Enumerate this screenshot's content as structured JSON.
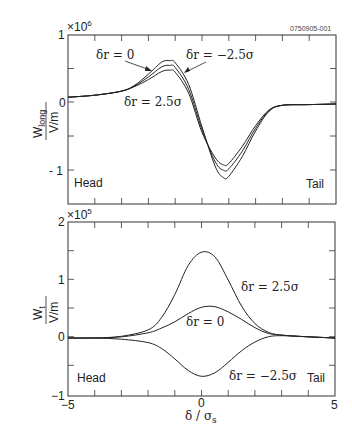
{
  "figure_id": "0750905-001",
  "chart_data": [
    {
      "type": "line",
      "panel": "top",
      "title": "",
      "xlabel": "δ / σs",
      "ylabel_numerator": "W_long",
      "ylabel_denominator": "V/m",
      "y_multiplier": "×10^6",
      "xlim": [
        -5,
        5
      ],
      "ylim": [
        -1.5,
        1
      ],
      "yticks": [
        1,
        0,
        -1
      ],
      "ytick_labels": [
        "1",
        "0",
        "-1"
      ],
      "grid": false,
      "annotations": [
        "Head",
        "Tail"
      ],
      "series": [
        {
          "name": "δr = 0",
          "x": [
            -5,
            -4,
            -3,
            -2.5,
            -2,
            -1.5,
            -1.2,
            -1,
            -0.5,
            0,
            0.5,
            0.8,
            1,
            1.5,
            2,
            2.5,
            3,
            4,
            5
          ],
          "y": [
            0.08,
            0.11,
            0.17,
            0.25,
            0.38,
            0.53,
            0.55,
            0.52,
            0.2,
            -0.4,
            -0.88,
            -1.0,
            -0.98,
            -0.72,
            -0.38,
            -0.12,
            -0.04,
            -0.03,
            -0.02
          ]
        },
        {
          "name": "δr = -2.5σ",
          "x": [
            -5,
            -4,
            -3,
            -2.5,
            -2,
            -1.5,
            -1.2,
            -1,
            -0.5,
            0,
            0.5,
            0.8,
            1,
            1.5,
            2,
            2.5,
            3,
            4,
            5
          ],
          "y": [
            0.08,
            0.11,
            0.17,
            0.26,
            0.42,
            0.6,
            0.62,
            0.59,
            0.27,
            -0.36,
            -0.95,
            -1.11,
            -1.09,
            -0.8,
            -0.42,
            -0.13,
            -0.04,
            -0.03,
            -0.02
          ]
        },
        {
          "name": "δr = 2.5σ",
          "x": [
            -5,
            -4,
            -3,
            -2.5,
            -2,
            -1.5,
            -1.2,
            -1,
            -0.5,
            0,
            0.5,
            0.8,
            1,
            1.5,
            2,
            2.5,
            3,
            4,
            5
          ],
          "y": [
            0.08,
            0.11,
            0.17,
            0.24,
            0.34,
            0.46,
            0.48,
            0.45,
            0.14,
            -0.44,
            -0.82,
            -0.92,
            -0.9,
            -0.65,
            -0.34,
            -0.11,
            -0.04,
            -0.03,
            -0.02
          ]
        }
      ],
      "labels": {
        "dr0": "δr = 0",
        "drneg": "δr = −2.5σ",
        "drpos": "δr = 2.5σ"
      }
    },
    {
      "type": "line",
      "panel": "bottom",
      "title": "",
      "xlabel": "δ / σs",
      "ylabel_numerator": "W_t",
      "ylabel_denominator": "V/m",
      "y_multiplier": "×10^5",
      "xlim": [
        -5,
        5
      ],
      "ylim": [
        -1,
        2
      ],
      "xticks": [
        -5,
        0,
        5
      ],
      "yticks": [
        2,
        1,
        0,
        -1
      ],
      "ytick_labels": [
        "2",
        "1",
        "0",
        "-1"
      ],
      "grid": false,
      "annotations": [
        "Head",
        "Tail"
      ],
      "series": [
        {
          "name": "δr = 2.5σ",
          "x": [
            -5,
            -4,
            -3,
            -2,
            -1.5,
            -1,
            -0.5,
            0,
            0.5,
            1,
            1.5,
            2,
            2.5,
            3,
            4,
            5
          ],
          "y": [
            0,
            0.0,
            0.03,
            0.14,
            0.35,
            0.75,
            1.25,
            1.48,
            1.4,
            1.0,
            0.55,
            0.25,
            0.1,
            0.05,
            0.02,
            0.0
          ]
        },
        {
          "name": "δr = 0",
          "x": [
            -5,
            -4,
            -3,
            -2,
            -1.5,
            -1,
            -0.5,
            0,
            0.5,
            1,
            1.5,
            2,
            2.5,
            3,
            4,
            5
          ],
          "y": [
            0,
            0.0,
            0.02,
            0.09,
            0.17,
            0.28,
            0.42,
            0.53,
            0.54,
            0.45,
            0.32,
            0.18,
            0.08,
            0.05,
            0.02,
            0.0
          ]
        },
        {
          "name": "δr = -2.5σ",
          "x": [
            -5,
            -4,
            -3,
            -2,
            -1.5,
            -1,
            -0.5,
            0,
            0.5,
            1,
            1.5,
            2,
            2.5,
            3,
            4,
            5
          ],
          "y": [
            0,
            0.0,
            -0.02,
            -0.08,
            -0.18,
            -0.36,
            -0.56,
            -0.66,
            -0.6,
            -0.42,
            -0.22,
            -0.07,
            0.02,
            0.04,
            0.02,
            0.0
          ]
        }
      ],
      "labels": {
        "dr0": "δr = 0",
        "drneg": "δr = −2.5σ",
        "drpos": "δr = 2.5σ"
      }
    }
  ],
  "text": {
    "top_mult_base": "×10",
    "top_mult_exp": "6",
    "bot_mult_base": "×10",
    "bot_mult_exp": "5",
    "top_ylab_main": "W",
    "top_ylab_sub": "long",
    "bot_ylab_main": "W",
    "bot_ylab_sub": "t",
    "ylab_den": "V/m",
    "head": "Head",
    "tail": "Tail",
    "xlabel_main": "δ / σ",
    "xlabel_sub": "s",
    "xtick_m5": "−5",
    "xtick_0": "0",
    "xtick_5": "5",
    "top_y1": "1",
    "top_y0": "0",
    "top_ym1": "- 1",
    "bot_y2": "2",
    "bot_y1": "1",
    "bot_y0": "0",
    "bot_ym1": "−1",
    "lab_top_dr0": "δr = 0",
    "lab_top_drneg": "δr = −2.5σ",
    "lab_top_drpos": "δr = 2.5σ",
    "lab_bot_drpos": "δr = 2.5σ",
    "lab_bot_dr0": "δr = 0",
    "lab_bot_drneg": "δr = −2.5σ"
  }
}
